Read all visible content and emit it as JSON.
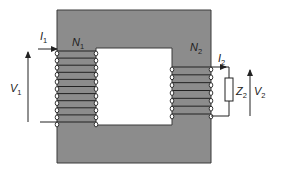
{
  "colors": {
    "core_fill": "#8c8c8c",
    "core_stroke": "#3a3a3a",
    "wire": "#222222",
    "background": "#ffffff",
    "window": "#ffffff"
  },
  "labels": {
    "primary_current": {
      "main": "I",
      "sub": "1"
    },
    "primary_turns": {
      "main": "N",
      "sub": "1"
    },
    "primary_voltage": {
      "main": "V",
      "sub": "1"
    },
    "secondary_current": {
      "main": "I",
      "sub": "2"
    },
    "secondary_turns": {
      "main": "N",
      "sub": "2"
    },
    "secondary_voltage": {
      "main": "V",
      "sub": "2"
    },
    "load_impedance": {
      "main": "Z",
      "sub": "2"
    }
  },
  "components": {
    "core": {
      "shape": "rectangular",
      "window": true
    },
    "primary_winding": {
      "limb": "left",
      "turns_drawn": 11
    },
    "secondary_winding": {
      "limb": "right",
      "turns_drawn": 7
    },
    "load": {
      "type": "impedance",
      "symbol": "rectangle"
    }
  }
}
